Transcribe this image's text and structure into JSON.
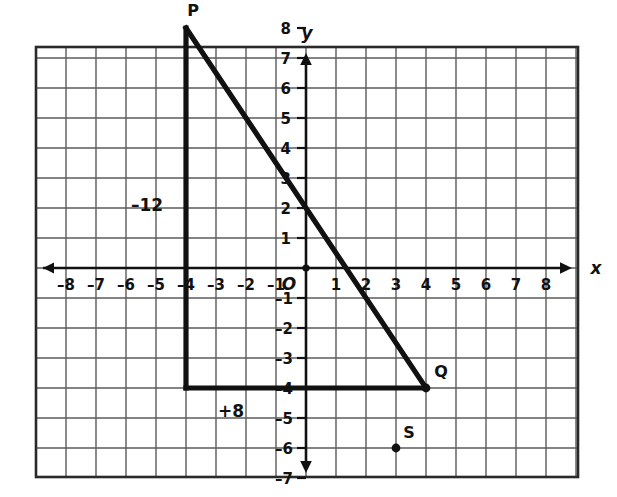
{
  "figure": {
    "type": "coordinate-grid-diagram",
    "background_color": "#ffffff",
    "ink_color": "#111111",
    "grid_color": "#5b5b5b",
    "border_color": "#2a2a2a"
  },
  "axes": {
    "x_label": "x",
    "y_label": "y",
    "origin_label": "O",
    "x_ticks": [
      "–8",
      "–7",
      "–6",
      "–5",
      "–4",
      "–3",
      "–2",
      "–1",
      "1",
      "2",
      "3",
      "4",
      "5",
      "6",
      "7",
      "8"
    ],
    "y_ticks_positive": [
      "8",
      "7",
      "6",
      "5",
      "4",
      "3",
      "2",
      "1"
    ],
    "y_ticks_negative": [
      "–1",
      "–2",
      "–3",
      "–4",
      "–5",
      "–6",
      "–7",
      "–8"
    ],
    "x_range": [
      -8,
      8
    ],
    "y_range": [
      -8,
      8
    ],
    "grid_step": 1
  },
  "chart_data": {
    "type": "scatter",
    "title": "",
    "xlabel": "x",
    "ylabel": "y",
    "xlim": [
      -8,
      8
    ],
    "ylim": [
      -8,
      8
    ],
    "grid": true,
    "legend": "none",
    "points": [
      {
        "name": "P",
        "x": -4,
        "y": 8,
        "label": "P",
        "marked": false
      },
      {
        "name": "Q",
        "x": 4,
        "y": -4,
        "label": "Q",
        "marked": true
      },
      {
        "name": "S",
        "x": 3,
        "y": -6,
        "label": "S",
        "marked": true
      }
    ],
    "segments": [
      {
        "name": "vertical-leg",
        "from": [
          -4,
          8
        ],
        "to": [
          -4,
          -4
        ],
        "label": "–12"
      },
      {
        "name": "horizontal-leg",
        "from": [
          -4,
          -4
        ],
        "to": [
          4,
          -4
        ],
        "label": "+8"
      },
      {
        "name": "hypotenuse",
        "from": [
          -4,
          8
        ],
        "to": [
          4,
          -4
        ],
        "label": ""
      }
    ],
    "annotations": [
      {
        "text": "–12",
        "x": -5.3,
        "y": 2.1
      },
      {
        "text": "+8",
        "x": -2.5,
        "y": -4.75
      }
    ]
  },
  "labels": {
    "p": "P",
    "q": "Q",
    "s": "S",
    "vertical_change": "–12",
    "horizontal_change": "+8"
  }
}
